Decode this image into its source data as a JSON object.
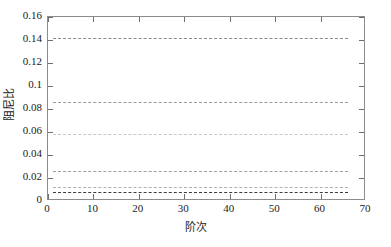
{
  "chart_data": {
    "type": "line",
    "title": "",
    "xlabel": "阶次",
    "ylabel": "阻尼比",
    "xlim": [
      0,
      70
    ],
    "ylim": [
      0,
      0.16
    ],
    "xticks": [
      0,
      10,
      20,
      30,
      40,
      50,
      60,
      70
    ],
    "xtick_labels": [
      "0",
      "10",
      "20",
      "30",
      "40",
      "50",
      "60",
      "70"
    ],
    "yticks": [
      0,
      0.02,
      0.04,
      0.06,
      0.08,
      0.1,
      0.12,
      0.14,
      0.16
    ],
    "ytick_labels": [
      "0",
      "0.02",
      "0.04",
      "0.06",
      "0.08",
      "0.1",
      "0.12",
      "0.14",
      "0.16"
    ],
    "grid": false,
    "legend": "none",
    "x_range_of_data": [
      1,
      66
    ],
    "series": [
      {
        "name": "mode-1",
        "style": "dashed",
        "color": "#8a8a8a",
        "linewidth": 1.2,
        "dash": "3px 2px",
        "constant_value": 0.142,
        "x": [
          1,
          66
        ],
        "values": [
          0.142,
          0.142
        ]
      },
      {
        "name": "mode-2",
        "style": "dashed",
        "color": "#9a9a9a",
        "linewidth": 1.2,
        "dash": "3px 2px",
        "constant_value": 0.086,
        "x": [
          1,
          66
        ],
        "values": [
          0.086,
          0.086
        ]
      },
      {
        "name": "mode-3",
        "style": "dashed",
        "color": "#c8c8c8",
        "linewidth": 1.0,
        "dash": "3px 2px",
        "constant_value": 0.058,
        "x": [
          1,
          66
        ],
        "values": [
          0.058,
          0.058
        ]
      },
      {
        "name": "mode-4",
        "style": "dashed",
        "color": "#a0a0a0",
        "linewidth": 1.2,
        "dash": "3px 2px",
        "constant_value": 0.026,
        "x": [
          1,
          66
        ],
        "values": [
          0.026,
          0.026
        ]
      },
      {
        "name": "mode-5",
        "style": "dashed",
        "color": "#b0b0b0",
        "linewidth": 1.0,
        "dash": "3px 2px",
        "constant_value": 0.0118,
        "x": [
          1,
          66
        ],
        "values": [
          0.0118,
          0.0118
        ]
      },
      {
        "name": "mode-6",
        "style": "dashed",
        "color": "#3c3c3c",
        "linewidth": 1.6,
        "dash": "4px 2px",
        "constant_value": 0.008,
        "x": [
          1,
          66
        ],
        "values": [
          0.008,
          0.008
        ]
      }
    ]
  },
  "axes": {
    "frame_color": "#8c8c8c",
    "tick_color": "#6e6e6e",
    "text_color": "#1a1a1a",
    "background": "#ffffff"
  }
}
